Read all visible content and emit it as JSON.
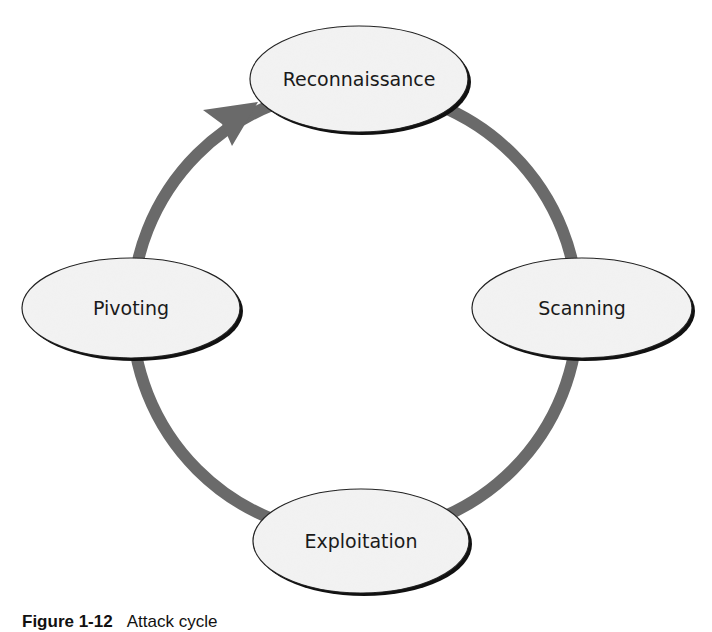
{
  "diagram": {
    "type": "cycle",
    "direction": "clockwise",
    "colors": {
      "arc": "#6a6a6a",
      "node_fill": "#f2f2f2",
      "node_stroke": "#1a1a1a",
      "node_shadow": "#111111",
      "text": "#1a1a1a"
    },
    "nodes": [
      {
        "id": "reconnaissance",
        "label": "Reconnaissance"
      },
      {
        "id": "scanning",
        "label": "Scanning"
      },
      {
        "id": "exploitation",
        "label": "Exploitation"
      },
      {
        "id": "pivoting",
        "label": "Pivoting"
      }
    ],
    "edges": [
      {
        "from": "reconnaissance",
        "to": "scanning"
      },
      {
        "from": "scanning",
        "to": "exploitation"
      },
      {
        "from": "exploitation",
        "to": "pivoting"
      },
      {
        "from": "pivoting",
        "to": "reconnaissance",
        "arrowhead": true
      }
    ]
  },
  "caption": {
    "figure_number": "Figure 1-12",
    "text": "Attack cycle"
  }
}
